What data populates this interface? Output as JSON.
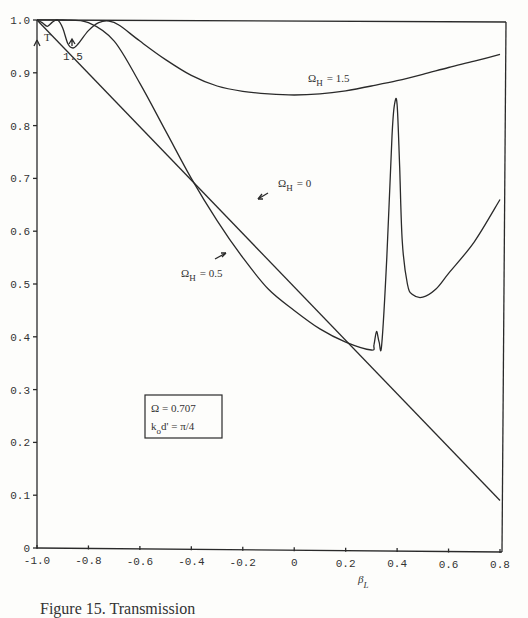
{
  "chart_data": {
    "type": "line",
    "title": "",
    "xlabel": "β_L",
    "ylabel": "T",
    "xlim": [
      -1.0,
      0.8
    ],
    "ylim": [
      0,
      1.0
    ],
    "grid": false,
    "x_ticks": [
      "-1.0",
      "-0.8",
      "-0.6",
      "-0.4",
      "-0.2",
      "0",
      "0.2",
      "0.4",
      "0.6",
      "0.8"
    ],
    "y_ticks": [
      "0",
      "0.1",
      "0.2",
      "0.3",
      "0.4",
      "0.5",
      "0.6",
      "0.7",
      "0.8",
      "0.9",
      "1.0"
    ],
    "series": [
      {
        "name": "Ω_H = 0",
        "x": [
          -1.0,
          0.8
        ],
        "y": [
          1.0,
          0.09
        ]
      },
      {
        "name": "Ω_H = 0.5",
        "x": [
          -1.0,
          -0.9,
          -0.8,
          -0.7,
          -0.6,
          -0.5,
          -0.4,
          -0.3,
          -0.2,
          -0.1,
          0.0,
          0.1,
          0.2,
          0.3,
          0.31,
          0.32,
          0.33,
          0.34,
          0.36,
          0.38,
          0.39,
          0.4,
          0.41,
          0.42,
          0.44,
          0.46,
          0.5,
          0.55,
          0.6,
          0.7,
          0.8
        ],
        "y": [
          1.0,
          1.0,
          0.995,
          0.96,
          0.88,
          0.79,
          0.7,
          0.62,
          0.55,
          0.49,
          0.45,
          0.415,
          0.39,
          0.375,
          0.385,
          0.41,
          0.39,
          0.385,
          0.55,
          0.78,
          0.84,
          0.84,
          0.72,
          0.58,
          0.5,
          0.48,
          0.475,
          0.49,
          0.52,
          0.58,
          0.66
        ]
      },
      {
        "name": "Ω_H = 1.5",
        "x": [
          -1.0,
          -0.98,
          -0.96,
          -0.94,
          -0.92,
          -0.9,
          -0.88,
          -0.86,
          -0.84,
          -0.8,
          -0.76,
          -0.72,
          -0.68,
          -0.6,
          -0.5,
          -0.4,
          -0.3,
          -0.2,
          -0.1,
          0.0,
          0.1,
          0.2,
          0.3,
          0.4,
          0.5,
          0.6,
          0.7,
          0.8
        ],
        "y": [
          1.0,
          0.995,
          0.988,
          0.996,
          1.0,
          0.985,
          0.955,
          0.947,
          0.955,
          0.98,
          0.995,
          0.998,
          0.99,
          0.96,
          0.925,
          0.895,
          0.875,
          0.865,
          0.86,
          0.858,
          0.86,
          0.866,
          0.875,
          0.885,
          0.897,
          0.91,
          0.922,
          0.935
        ]
      }
    ],
    "annotations": [
      {
        "text": "Ω_H = 1.5",
        "x": -0.1,
        "y": 0.89
      },
      {
        "text": "Ω_H = 0",
        "x": -0.15,
        "y": 0.705
      },
      {
        "text": "Ω_H = 0.5",
        "x": -0.5,
        "y": 0.515
      },
      {
        "text": "1.5",
        "x": -0.87,
        "y": 0.93
      },
      {
        "text": "T",
        "x": -0.97,
        "y": 0.98
      }
    ],
    "legend_box": [
      "Ω = 0.707",
      "k_o d' = π/4"
    ]
  },
  "labels": {
    "omega_h_15": "Ω",
    "omega_h_15_sub": "H",
    "omega_h_15_val": "= 1.5",
    "omega_h_0": "Ω",
    "omega_h_0_sub": "H",
    "omega_h_0_val": "= 0",
    "omega_h_05": "Ω",
    "omega_h_05_sub": "H",
    "omega_h_05_val": "= 0.5",
    "dip_label": "1.5",
    "y_axis_label": "T",
    "x_axis_label": "β",
    "x_axis_sub": "L",
    "box_line1": "Ω = 0.707",
    "box_line2_k": "k",
    "box_line2_sub": "o",
    "box_line2_rest": "d' =  π/4"
  },
  "caption": "Figure 15.  Transmission"
}
